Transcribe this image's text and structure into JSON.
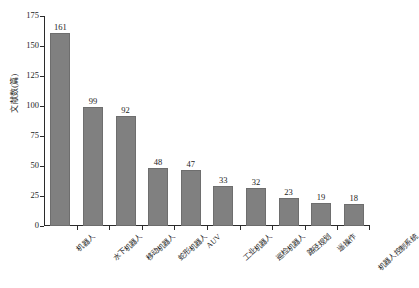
{
  "chart_data": {
    "type": "bar",
    "title": "",
    "subtitle": "",
    "xlabel": "",
    "ylabel": "文献数(篇)",
    "ylim": [
      0,
      175
    ],
    "yticks": [
      0,
      25,
      50,
      75,
      100,
      125,
      150,
      175
    ],
    "ytick_labels": [
      "0",
      "25",
      "50",
      "75",
      "100",
      "125",
      "150",
      "175"
    ],
    "grid": false,
    "legend": null,
    "bar_color": "#808080",
    "axis_color": "#2b2b2b",
    "categories": [
      "机器人",
      "水下机器人",
      "移动机器人",
      "蛇形机器人",
      "AUV",
      "工业机器人",
      "巡检机器人",
      "路径规划",
      "遥操作",
      "机器人控制系统"
    ],
    "values": [
      161,
      99,
      92,
      48,
      47,
      33,
      32,
      23,
      19,
      18
    ],
    "value_labels": [
      "161",
      "99",
      "92",
      "48",
      "47",
      "33",
      "32",
      "23",
      "19",
      "18"
    ]
  }
}
